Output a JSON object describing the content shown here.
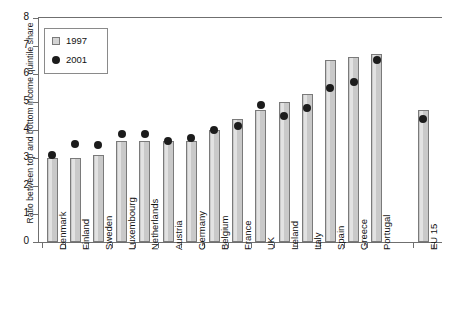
{
  "chart_data": {
    "type": "bar",
    "title": "",
    "xlabel": "",
    "ylabel": "Ratio between top and bottom income quintile share",
    "ylim": [
      0,
      8
    ],
    "ytick_labels": [
      "0",
      "1",
      "2",
      "3",
      "4",
      "5",
      "6",
      "7",
      "8"
    ],
    "ytick_values": [
      0,
      1,
      2,
      3,
      4,
      5,
      6,
      7,
      8
    ],
    "grid": false,
    "legend_position": "top-left",
    "categories": [
      "Denmark",
      "Finland",
      "Sweden",
      "Luxembourg",
      "Netherlands",
      "Austria",
      "Germany",
      "Belgium",
      "France",
      "UK",
      "Ireland",
      "Italy",
      "Spain",
      "Greece",
      "Portugal",
      "EU 15"
    ],
    "series": [
      {
        "name": "1997",
        "marker": "bar",
        "color": "#c9c9c9",
        "values": [
          3.0,
          3.0,
          3.1,
          3.6,
          3.6,
          3.6,
          3.6,
          4.0,
          4.4,
          4.7,
          5.0,
          5.3,
          6.5,
          6.6,
          6.7,
          4.7
        ]
      },
      {
        "name": "2001",
        "marker": "dot",
        "color": "#1c1c1c",
        "values": [
          3.1,
          3.5,
          3.45,
          3.85,
          3.85,
          3.6,
          3.7,
          4.0,
          4.15,
          4.9,
          4.5,
          4.8,
          5.5,
          5.7,
          6.5,
          4.4
        ]
      }
    ]
  },
  "legend": {
    "items": [
      {
        "label": "1997",
        "swatch": "square-swatch"
      },
      {
        "label": "2001",
        "swatch": "dot-swatch"
      }
    ]
  }
}
